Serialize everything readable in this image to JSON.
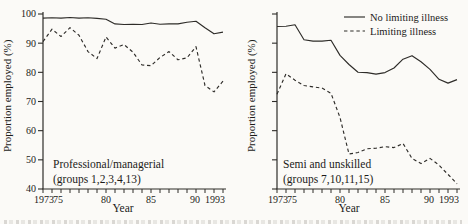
{
  "figure": {
    "ylabel": "Proportion employed (%)",
    "xlabel": "Year",
    "line_color": "#2e2c29",
    "text_color": "#1c1b19",
    "background": "#fbfaf7"
  },
  "legend": {
    "position": "top-right-of-right-panel",
    "items": [
      {
        "label": "No limiting illness",
        "style": "solid"
      },
      {
        "label": "Limiting illness",
        "style": "dashed"
      }
    ]
  },
  "chart_data": [
    {
      "type": "line",
      "panel": "left",
      "annotation_lines": [
        "Professional/managerial",
        "(groups 1,2,3,4,13)"
      ],
      "xlabel": "Year",
      "ylabel": "Proportion employed (%)",
      "ylim": [
        40,
        100
      ],
      "yticks": [
        40,
        50,
        60,
        70,
        80,
        90,
        100
      ],
      "show_ytick_labels": true,
      "xlim": [
        1973,
        1993
      ],
      "xtick_minor_every": 1,
      "xtick_labels": [
        [
          1973,
          "1973"
        ],
        [
          1975,
          "75"
        ],
        [
          1980,
          "80"
        ],
        [
          1985,
          "85"
        ],
        [
          1990,
          "90"
        ],
        [
          1993,
          "1993"
        ]
      ],
      "x": [
        1973,
        1974,
        1975,
        1976,
        1977,
        1978,
        1979,
        1980,
        1981,
        1982,
        1983,
        1984,
        1985,
        1986,
        1987,
        1988,
        1989,
        1990,
        1991,
        1992,
        1993
      ],
      "series": [
        {
          "name": "No limiting illness",
          "style": "solid",
          "values": [
            98.6,
            98.7,
            98.6,
            98.8,
            98.6,
            98.7,
            98.5,
            98.2,
            96.6,
            96.4,
            96.5,
            96.4,
            96.9,
            96.5,
            96.6,
            96.6,
            97.2,
            97.5,
            95.3,
            93.2,
            93.8
          ]
        },
        {
          "name": "Limiting illness",
          "style": "dashed",
          "values": [
            90.5,
            94.8,
            92.3,
            95.3,
            92.7,
            87.1,
            84.7,
            92.1,
            88.3,
            89.5,
            86.9,
            82.5,
            82.3,
            85.1,
            87.1,
            84.3,
            85.0,
            88.8,
            75.5,
            73.3,
            77.0
          ]
        }
      ],
      "legend_visible": false,
      "grid": false
    },
    {
      "type": "line",
      "panel": "right",
      "annotation_lines": [
        "Semi and unskilled",
        "(groups 7,10,11,15)"
      ],
      "xlabel": "Year",
      "ylabel": "Proportion employed (%)",
      "ylim": [
        40,
        100
      ],
      "yticks": [
        40,
        50,
        60,
        70,
        80,
        90,
        100
      ],
      "show_ytick_labels": false,
      "xlim": [
        1973,
        1993
      ],
      "xtick_minor_every": 1,
      "xtick_labels": [
        [
          1973,
          "1973"
        ],
        [
          1975,
          "75"
        ],
        [
          1980,
          "80"
        ],
        [
          1985,
          "85"
        ],
        [
          1990,
          "90"
        ],
        [
          1993,
          "1993"
        ]
      ],
      "x": [
        1973,
        1974,
        1975,
        1976,
        1977,
        1978,
        1979,
        1980,
        1981,
        1982,
        1983,
        1984,
        1985,
        1986,
        1987,
        1988,
        1989,
        1990,
        1991,
        1992,
        1993
      ],
      "series": [
        {
          "name": "No limiting illness",
          "style": "solid",
          "values": [
            95.7,
            95.8,
            96.3,
            91.2,
            90.7,
            90.7,
            91.0,
            85.8,
            82.7,
            80.0,
            79.9,
            79.4,
            79.9,
            81.5,
            84.5,
            85.7,
            83.6,
            81.0,
            77.6,
            76.3,
            77.5
          ]
        },
        {
          "name": "Limiting illness",
          "style": "dashed",
          "values": [
            72.5,
            79.5,
            77.3,
            75.5,
            75.0,
            74.6,
            72.8,
            64.5,
            52.0,
            52.5,
            53.8,
            54.0,
            54.5,
            54.2,
            55.6,
            50.5,
            48.7,
            50.5,
            48.2,
            45.0,
            41.8
          ]
        }
      ],
      "legend_visible": true,
      "grid": false
    }
  ]
}
